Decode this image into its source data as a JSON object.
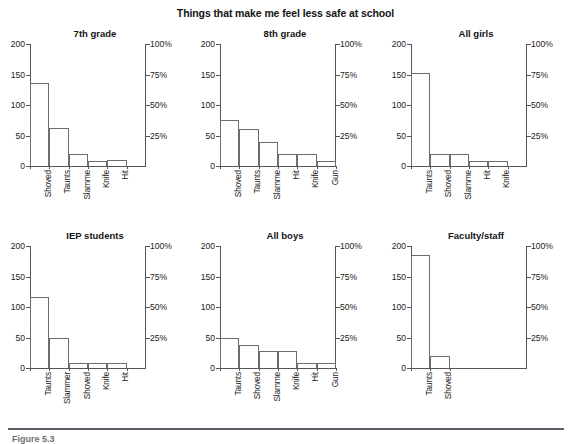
{
  "figure": {
    "title": "Things that make me feel less safe at school",
    "caption": "Figure 5.3",
    "rule_color": "#5c5c66"
  },
  "chart_data": {
    "type": "bar",
    "title": "Things that make me feel less safe at school",
    "xlabel": "",
    "ylabel": "",
    "ylim": [
      0,
      200
    ],
    "y_ticks": [
      0,
      50,
      100,
      150,
      200
    ],
    "y2lim": [
      0,
      100
    ],
    "y2_ticks": [
      "25%",
      "50%",
      "75%",
      "100%"
    ],
    "y2_tick_values": [
      25,
      50,
      75,
      100
    ],
    "grid": false,
    "legend": "none",
    "layout": "2 rows x 3 columns of small multiples",
    "bar_style": "contiguous unfilled outlined bars (histogram style)",
    "panels": [
      {
        "title": "7th grade",
        "categories": [
          "Shoved",
          "Taunts",
          "Slammed",
          "Knife",
          "Hit"
        ],
        "values": [
          136,
          62,
          19,
          9,
          10
        ],
        "display_labels": [
          "Shoved",
          "Taunts",
          "Slamme",
          "Knife",
          "Hit"
        ]
      },
      {
        "title": "8th grade",
        "categories": [
          "Shoved",
          "Taunts",
          "Slammed",
          "Hit",
          "Knife",
          "Gun"
        ],
        "values": [
          76,
          60,
          40,
          19,
          19,
          9
        ],
        "display_labels": [
          "Shoved",
          "Taunts",
          "Slamme",
          "Hit",
          "Knife",
          "Gun"
        ]
      },
      {
        "title": "All girls",
        "categories": [
          "Taunts",
          "Shoved",
          "Slammed",
          "Hit",
          "Knife"
        ],
        "values": [
          152,
          20,
          20,
          9,
          9
        ],
        "display_labels": [
          "Taunts",
          "Shoved",
          "Slamme",
          "Hit",
          "Knife"
        ]
      },
      {
        "title": "IEP students",
        "categories": [
          "Taunts",
          "Slammed",
          "Shoved",
          "Knife",
          "Hit"
        ],
        "values": [
          117,
          50,
          9,
          9,
          9
        ],
        "display_labels": [
          "Taunts",
          "Slammer",
          "Shoved",
          "Knife",
          "Hit"
        ]
      },
      {
        "title": "All boys",
        "categories": [
          "Taunts",
          "Shoved",
          "Slammed",
          "Knife",
          "Hit",
          "Gun"
        ],
        "values": [
          50,
          37,
          28,
          28,
          8,
          8
        ],
        "display_labels": [
          "Taunts",
          "Shoved",
          "Slamme",
          "Knife",
          "Hit",
          "Gun"
        ]
      },
      {
        "title": "Faculty/staff",
        "categories": [
          "Taunts",
          "Shoved"
        ],
        "values": [
          186,
          20
        ],
        "display_labels": [
          "Taunts",
          "Shoved"
        ]
      }
    ]
  }
}
